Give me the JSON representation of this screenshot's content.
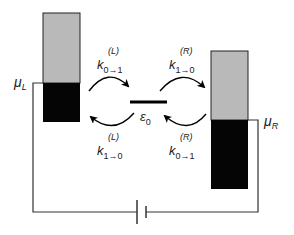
{
  "diagram": {
    "colors": {
      "electrode_empty": "#b9b9b9",
      "electrode_filled": "#050505",
      "wire": "#333333"
    },
    "left_electrode": {
      "chem_potential_label": "μ",
      "chem_potential_sub": "L"
    },
    "right_electrode": {
      "chem_potential_label": "μ",
      "chem_potential_sub": "R"
    },
    "level": {
      "label": "ε",
      "sub": "0"
    },
    "rates": {
      "top_left": {
        "k": "k",
        "sub": "0→1",
        "sup": "(L)"
      },
      "bottom_left": {
        "k": "k",
        "sub": "1→0",
        "sup": "(L)"
      },
      "top_right": {
        "k": "k",
        "sub": "1→0",
        "sup": "(R)"
      },
      "bottom_right": {
        "k": "k",
        "sub": "0→1",
        "sup": "(R)"
      }
    },
    "battery": {
      "symbol": "voltage-source"
    }
  }
}
